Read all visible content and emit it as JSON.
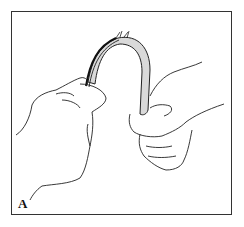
{
  "figure": {
    "panel_label": "A",
    "colors": {
      "line": "#222222",
      "strip_fill": "#d9d9d9",
      "background": "#ffffff",
      "border": "#333333"
    }
  }
}
